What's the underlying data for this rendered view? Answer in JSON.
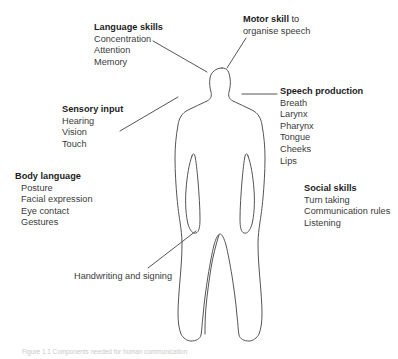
{
  "figure": {
    "caption": "Figure 1.1 Components needed for human communication",
    "stroke_color": "#555555",
    "text_color": "#2b2b2b",
    "background_color": "#ffffff"
  },
  "callouts": [
    {
      "id": "language-skills",
      "heading": "Language skills",
      "heading_suffix": "",
      "items": [
        "Concentration",
        "Attention",
        "Memory"
      ]
    },
    {
      "id": "motor-skill",
      "heading": "Motor skill",
      "heading_suffix": " to",
      "items": [
        "organise speech"
      ]
    },
    {
      "id": "sensory-input",
      "heading": "Sensory input",
      "heading_suffix": "",
      "items": [
        "Hearing",
        "Vision",
        "Touch"
      ]
    },
    {
      "id": "speech-production",
      "heading": "Speech production",
      "heading_suffix": "",
      "items": [
        "Breath",
        "Larynx",
        "Pharynx",
        "Tongue",
        "Cheeks",
        "Lips"
      ]
    },
    {
      "id": "body-language",
      "heading": "Body language",
      "heading_suffix": "",
      "items": [
        "Posture",
        "Facial expression",
        "Eye contact",
        "Gestures"
      ]
    },
    {
      "id": "social-skills",
      "heading": "Social skills",
      "heading_suffix": "",
      "items": [
        "Turn taking",
        "Communication rules",
        "Listening"
      ]
    }
  ],
  "notes": {
    "handwriting": "Handwriting and signing"
  },
  "labels": {
    "language_heading": "Language skills",
    "language_item_0": "Concentration",
    "language_item_1": "Attention",
    "language_item_2": "Memory",
    "motor_heading": "Motor skill",
    "motor_suffix": " to",
    "motor_item_0": "organise speech",
    "sensory_heading": "Sensory input",
    "sensory_item_0": "Hearing",
    "sensory_item_1": "Vision",
    "sensory_item_2": "Touch",
    "speech_heading": "Speech production",
    "speech_item_0": "Breath",
    "speech_item_1": "Larynx",
    "speech_item_2": "Pharynx",
    "speech_item_3": "Tongue",
    "speech_item_4": "Cheeks",
    "speech_item_5": "Lips",
    "body_heading": "Body language",
    "body_item_0": "Posture",
    "body_item_1": "Facial expression",
    "body_item_2": "Eye contact",
    "body_item_3": "Gestures",
    "social_heading": "Social skills",
    "social_item_0": "Turn taking",
    "social_item_1": "Communication rules",
    "social_item_2": "Listening"
  }
}
